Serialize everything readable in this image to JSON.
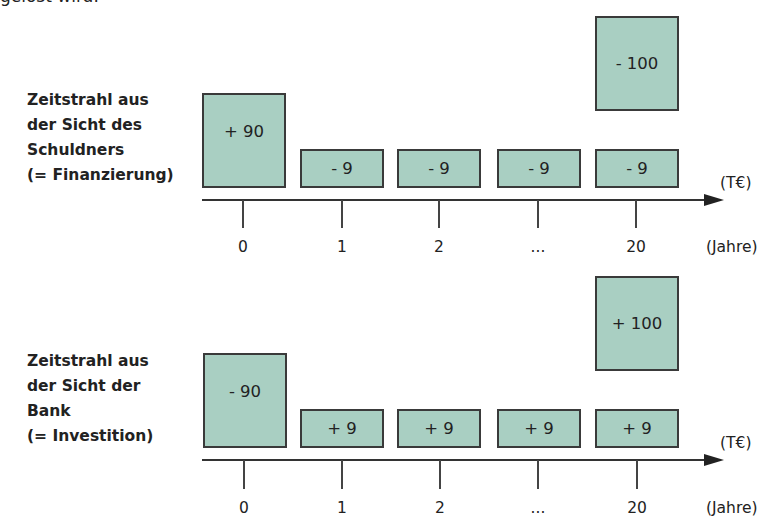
{
  "header_fragment": "gelöst wird.",
  "timelines": [
    {
      "id": "schuldner",
      "label_lines": [
        "Zeitstrahl aus",
        "der Sicht des",
        "Schuldners",
        "(= Finanzierung)"
      ],
      "boxes": [
        {
          "period": "0",
          "label": "+ 90"
        },
        {
          "period": "1",
          "label": "- 9"
        },
        {
          "period": "2",
          "label": "- 9"
        },
        {
          "period": "...",
          "label": "- 9"
        },
        {
          "period": "20",
          "label": "- 9"
        },
        {
          "period": "20",
          "label": "- 100"
        }
      ],
      "ticks": [
        "0",
        "1",
        "2",
        "...",
        "20"
      ],
      "unit_value": "(T€)",
      "unit_time": "(Jahre)"
    },
    {
      "id": "bank",
      "label_lines": [
        "Zeitstrahl aus",
        "der Sicht der",
        "Bank",
        "(= Investition)"
      ],
      "boxes": [
        {
          "period": "0",
          "label": "- 90"
        },
        {
          "period": "1",
          "label": "+ 9"
        },
        {
          "period": "2",
          "label": "+ 9"
        },
        {
          "period": "...",
          "label": "+ 9"
        },
        {
          "period": "20",
          "label": "+ 9"
        },
        {
          "period": "20",
          "label": "+ 100"
        }
      ],
      "ticks": [
        "0",
        "1",
        "2",
        "...",
        "20"
      ],
      "unit_value": "(T€)",
      "unit_time": "(Jahre)"
    }
  ],
  "colors": {
    "box_fill": "#a9cfc2",
    "box_border": "#3a3a3a",
    "axis": "#333333"
  }
}
